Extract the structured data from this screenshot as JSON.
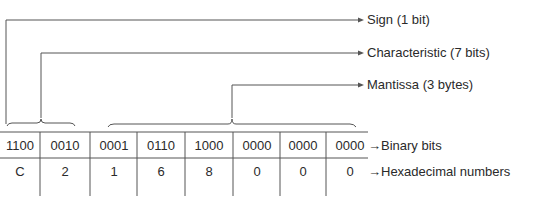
{
  "labels": {
    "sign": "Sign (1 bit)",
    "characteristic": "Characteristic (7 bits)",
    "mantissa": "Mantissa (3 bytes)",
    "binary_row": "Binary bits",
    "hex_row": "Hexadecimal numbers"
  },
  "arrow_glyph": "→",
  "binary": [
    "1100",
    "0010",
    "0001",
    "0110",
    "1000",
    "0000",
    "0000",
    "0000"
  ],
  "hex": [
    "C",
    "2",
    "1",
    "6",
    "8",
    "0",
    "0",
    "0"
  ],
  "colors": {
    "line": "#555555",
    "text": "#2a2a2a"
  }
}
